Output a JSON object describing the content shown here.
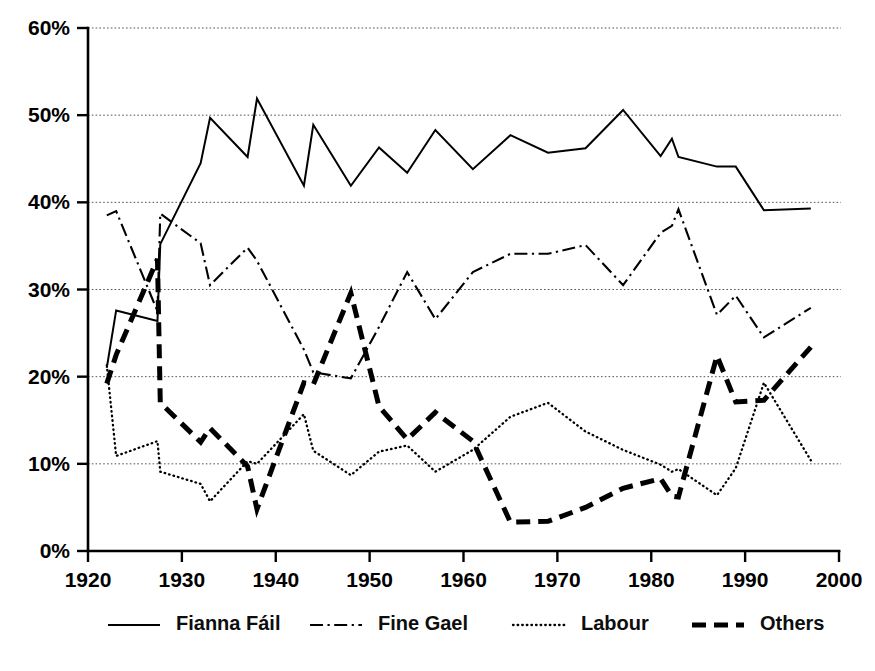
{
  "chart_data": {
    "type": "line",
    "title": "",
    "subtitle": "",
    "xlabel": "",
    "ylabel": "",
    "xlim": [
      1920,
      2000
    ],
    "ylim": [
      0,
      60
    ],
    "grid": true,
    "grid_axis": "y",
    "legend_position": "bottom",
    "x_ticks": [
      1920,
      1930,
      1940,
      1950,
      1960,
      1970,
      1980,
      1990,
      2000
    ],
    "x_tick_labels": [
      "1920",
      "1930",
      "1940",
      "1950",
      "1960",
      "1970",
      "1980",
      "1990",
      "2000"
    ],
    "y_ticks": [
      0,
      10,
      20,
      30,
      40,
      50,
      60
    ],
    "y_tick_labels": [
      "0%",
      "10%",
      "20%",
      "30%",
      "40%",
      "50%",
      "60%"
    ],
    "x": [
      1922,
      1923,
      1927.4,
      1927.7,
      1932,
      1933,
      1937,
      1938,
      1943,
      1944,
      1948,
      1951,
      1954,
      1957,
      1961,
      1965,
      1969,
      1973,
      1977,
      1981,
      1982.2,
      1982.9,
      1987,
      1989,
      1992,
      1997
    ],
    "series": [
      {
        "name": "Fianna Fáil",
        "style": "solid",
        "values": [
          21.0,
          27.6,
          26.4,
          35.2,
          44.5,
          49.7,
          45.2,
          51.9,
          41.9,
          48.9,
          41.9,
          46.3,
          43.4,
          48.3,
          43.8,
          47.7,
          45.7,
          46.2,
          50.6,
          45.3,
          47.3,
          45.2,
          44.1,
          44.1,
          39.1,
          39.3
        ],
        "last_values": [
          39.1,
          39.3
        ]
      },
      {
        "name": "Fine Gael",
        "style": "dash-dot",
        "values": [
          38.5,
          39.0,
          27.5,
          38.7,
          35.3,
          30.5,
          34.8,
          33.3,
          23.1,
          20.5,
          19.8,
          25.7,
          32.0,
          26.6,
          32.0,
          34.1,
          34.1,
          35.1,
          30.5,
          36.5,
          37.3,
          39.2,
          27.1,
          29.3,
          24.5,
          27.9
        ],
        "last_values": [
          24.5,
          27.9
        ]
      },
      {
        "name": "Labour",
        "style": "dotted",
        "values": [
          21.3,
          10.9,
          12.6,
          9.1,
          7.7,
          5.7,
          10.3,
          10.0,
          15.7,
          11.5,
          8.7,
          11.4,
          12.1,
          9.1,
          11.6,
          15.4,
          17.0,
          13.7,
          11.6,
          9.9,
          9.1,
          9.4,
          6.4,
          9.5,
          19.3,
          10.4
        ],
        "last_values": [
          19.3,
          10.4
        ]
      },
      {
        "name": "Others",
        "style": "heavy-dash",
        "values": [
          19.2,
          22.5,
          33.5,
          17.0,
          12.5,
          14.1,
          9.7,
          4.8,
          19.3,
          19.1,
          29.6,
          16.6,
          12.8,
          15.9,
          12.6,
          3.3,
          3.4,
          5.0,
          7.2,
          8.3,
          6.3,
          6.2,
          22.4,
          17.1,
          17.3,
          23.4
        ],
        "last_values": [
          17.3,
          23.4
        ]
      }
    ],
    "legend": [
      {
        "label": "Fianna Fáil",
        "style": "solid"
      },
      {
        "label": "Fine Gael",
        "style": "dash-dot"
      },
      {
        "label": "Labour",
        "style": "dotted"
      },
      {
        "label": "Others",
        "style": "heavy-dash"
      }
    ]
  },
  "colors": {
    "line": "#000000",
    "grid": "#555555",
    "background": "#ffffff",
    "text": "#000000"
  }
}
